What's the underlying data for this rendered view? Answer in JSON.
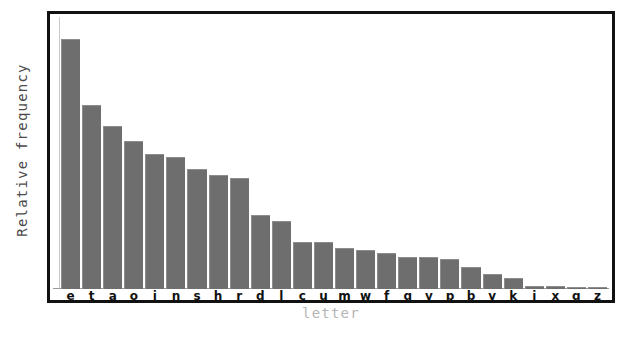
{
  "chart_data": {
    "type": "bar",
    "title": "",
    "xlabel": "letter",
    "ylabel": "Relative frequency",
    "categories": [
      "e",
      "t",
      "a",
      "o",
      "i",
      "n",
      "s",
      "h",
      "r",
      "d",
      "l",
      "c",
      "u",
      "m",
      "w",
      "f",
      "g",
      "y",
      "p",
      "b",
      "v",
      "k",
      "j",
      "x",
      "q",
      "z"
    ],
    "values": [
      12.7,
      9.1,
      8.2,
      7.5,
      7.0,
      6.7,
      6.3,
      6.1,
      6.0,
      4.3,
      4.0,
      2.8,
      2.8,
      2.4,
      2.4,
      2.2,
      2.0,
      2.0,
      1.9,
      1.5,
      1.0,
      0.8,
      0.15,
      0.15,
      0.1,
      0.07
    ],
    "bar_pixel_heights": [
      250,
      184,
      163,
      148,
      135,
      132,
      120,
      114,
      111,
      74,
      68,
      47,
      47,
      41,
      39,
      36,
      32,
      32,
      30,
      22,
      15,
      11,
      3,
      3,
      2,
      2
    ],
    "ylim": [
      0,
      13.2
    ],
    "grid": false,
    "legend": null,
    "legend_position": "none",
    "bar_color": "#6e6e6e",
    "frame_color": "#111111",
    "axis_label_color": "#4a4a4a",
    "xlabel_color": "#b5b5b5",
    "yticks": [],
    "ytick_labels": [],
    "note": "Relative frequency of letters in English text, sorted descending (ETAOIN SHRDLU ordering)"
  }
}
